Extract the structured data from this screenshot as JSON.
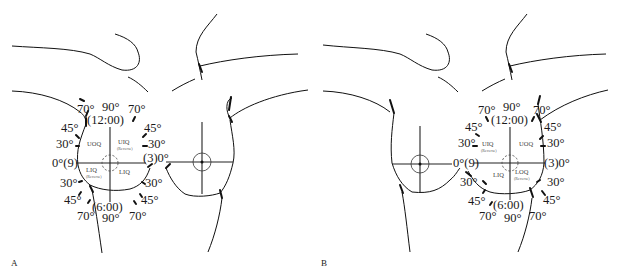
{
  "figure": {
    "panels": [
      {
        "id": "A",
        "label": "A",
        "clock_labels": {
          "top": "(12:00)",
          "bottom": "(6:00)",
          "left": "0°(9)",
          "right": "(3)0°"
        },
        "angle_labels": {
          "top": [
            "70°",
            "90°",
            "70°"
          ],
          "upper_left_45": "45°",
          "upper_right_45": "45°",
          "upper_left_30": "30°",
          "upper_right_30": "30°",
          "lower_left_30": "30°",
          "lower_right_30": "30°",
          "lower_left_45": "45°",
          "lower_right_45": "45°",
          "bottom": [
            "70°",
            "90°",
            "70°"
          ]
        },
        "quadrants": {
          "upper_left": "UOQ",
          "upper_right": "UIQ",
          "upper_right_note": "(Reverse)",
          "lower_left": "LIQ",
          "lower_left_note": "(Reverse)",
          "lower_right": "LIQ"
        }
      },
      {
        "id": "B",
        "label": "B",
        "clock_labels": {
          "top": "(12:00)",
          "bottom": "(6:00)",
          "left": "0°(9)",
          "right": "(3)0°"
        },
        "angle_labels": {
          "top": [
            "70°",
            "90°",
            "70°"
          ],
          "upper_left_45": "45°",
          "upper_right_45": "45°",
          "upper_left_30": "30°",
          "upper_right_30": "30°",
          "lower_left_30": "30°",
          "lower_right_30": "30°",
          "lower_left_45": "45°",
          "lower_right_45": "45°",
          "bottom": [
            "70°",
            "90°",
            "70°"
          ]
        },
        "quadrants": {
          "upper_left": "UIQ",
          "upper_left_note": "(Reverse)",
          "upper_right": "UOQ",
          "lower_left": "LIQ",
          "lower_right": "LOQ",
          "lower_right_note": "(Reverse)"
        }
      }
    ]
  }
}
